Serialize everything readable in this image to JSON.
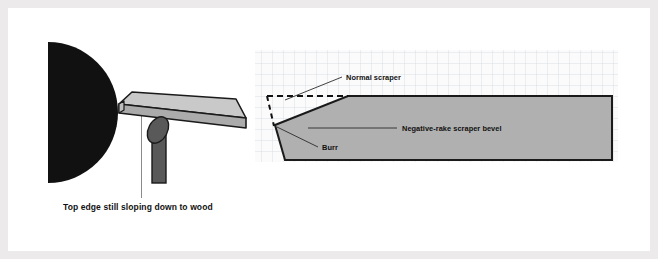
{
  "figure": {
    "title_none": "",
    "left_panel": {
      "caption": "Top edge still sloping down to wood",
      "parts": {
        "workpiece_label": "wood-blank-half-disc",
        "blade_label": "negative-rake-scraper-blade",
        "tool_rest_label": "tool-rest-post"
      }
    },
    "right_panel": {
      "labels": {
        "normal_scraper": "Normal scraper",
        "negative_rake_bevel": "Negative-rake scraper bevel",
        "burr": "Burr"
      },
      "grid": {
        "visible": true,
        "cell_px": 11
      }
    }
  },
  "colors": {
    "page_background": "#eceaea",
    "card_background": "#ffffff",
    "workpiece_black": "#111111",
    "blade_fill": "#b3b3b3",
    "blade_top_fill": "#c9c9c9",
    "blade_outline": "#1a1a1a",
    "tool_rest_fill": "#595959",
    "tool_rest_outline": "#1a1a1a",
    "grid_line": "#cfd8e0",
    "grid_background": "#fbfbfb",
    "label_text": "#111111",
    "leader_line": "#2b2b2b"
  }
}
